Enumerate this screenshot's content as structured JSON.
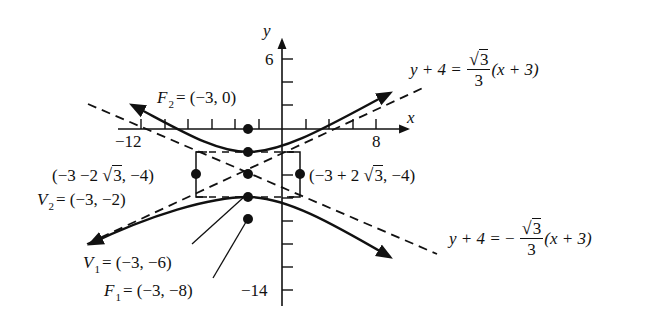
{
  "diagram": {
    "type": "hyperbola-graph",
    "axes": {
      "x_label": "x",
      "y_label": "y",
      "x_tick_labels": [
        {
          "value": -12,
          "text": "−12"
        },
        {
          "value": 8,
          "text": "8"
        }
      ],
      "y_tick_labels": [
        {
          "value": 6,
          "text": "6"
        },
        {
          "value": -14,
          "text": "−14"
        }
      ]
    },
    "points": {
      "F2": {
        "name": "F",
        "sub": "2",
        "coords": "= (−3, 0)"
      },
      "V2": {
        "name": "V",
        "sub": "2",
        "coords": "= (−3, −2)"
      },
      "V1": {
        "name": "V",
        "sub": "1",
        "coords": "= (−3, −6)"
      },
      "F1": {
        "name": "F",
        "sub": "1",
        "coords": "= (−3, −8)"
      },
      "left_box_point": {
        "pre": "(−3 −2 ",
        "rad": "3",
        "post": ", −4)"
      },
      "right_box_point": {
        "pre": "(−3 + 2 ",
        "rad": "3",
        "post": ", −4)"
      }
    },
    "asymptotes": {
      "positive": {
        "lhs": "y + 4 =",
        "num": "3",
        "den": "3",
        "rhs": "(x + 3)",
        "sign": ""
      },
      "negative": {
        "lhs": "y + 4 =",
        "num": "3",
        "den": "3",
        "rhs": "(x + 3)",
        "sign": "−"
      }
    },
    "colors": {
      "ink": "#111111",
      "background": "#ffffff"
    }
  }
}
